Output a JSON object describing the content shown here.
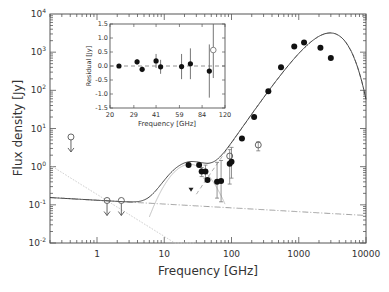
{
  "chart_data": {
    "type": "scatter",
    "title": "",
    "xlabel": "Frequency [GHz]",
    "ylabel": "Flux density [Jy]",
    "xscale": "log",
    "yscale": "log",
    "xlim": [
      0.2,
      10000
    ],
    "ylim": [
      0.01,
      10000
    ],
    "x_ticks": [
      "1",
      "10",
      "100",
      "1000",
      "10000"
    ],
    "y_ticks": [
      "10^-2",
      "10^-1",
      "10^0",
      "10^1",
      "10^2",
      "10^3",
      "10^4"
    ],
    "grid": false,
    "series": [
      {
        "name": "detections (filled)",
        "marker": "filled-circle",
        "points": [
          [
            23,
            1.1
          ],
          [
            33,
            1.1
          ],
          [
            36,
            0.75
          ],
          [
            41,
            0.75
          ],
          [
            44,
            0.45
          ],
          [
            61,
            0.4
          ],
          [
            70,
            0.42
          ],
          [
            94,
            1.2
          ],
          [
            100,
            1.35
          ],
          [
            143,
            5.5
          ],
          [
            217,
            20
          ],
          [
            353,
            95
          ],
          [
            545,
            400
          ],
          [
            857,
            1400
          ],
          [
            1200,
            1800
          ],
          [
            2100,
            1300
          ],
          [
            3000,
            700
          ]
        ]
      },
      {
        "name": "open circles",
        "marker": "open-circle",
        "points": [
          [
            94,
            1.9
          ],
          [
            250,
            3.7
          ]
        ]
      },
      {
        "name": "upper limits",
        "marker": "open-circle-arrow",
        "points": [
          [
            0.41,
            6.0
          ],
          [
            1.41,
            0.13
          ],
          [
            2.3,
            0.13
          ]
        ]
      },
      {
        "name": "triangle",
        "marker": "filled-triangle-down",
        "points": [
          [
            25,
            0.25
          ]
        ]
      },
      {
        "name": "total model",
        "style": "solid"
      },
      {
        "name": "free-free",
        "style": "dash-dot"
      },
      {
        "name": "synchrotron",
        "style": "dotted-grey"
      },
      {
        "name": "spinning dust",
        "style": "solid-grey"
      },
      {
        "name": "thermal dust low-freq",
        "style": "dashed-grey"
      }
    ],
    "inset": {
      "xlabel": "Frequency [GHz]",
      "ylabel": "Residual [Jy]",
      "xscale": "log",
      "xlim": [
        20,
        120
      ],
      "ylim": [
        -1.5,
        1.5
      ],
      "x_ticks": [
        "20",
        "29",
        "41",
        "59",
        "84",
        "120"
      ],
      "y_ticks": [
        "1.5",
        "1.0",
        "0.5",
        "0.0",
        "-0.5",
        "-1.0",
        "-1.5"
      ],
      "residuals": [
        {
          "x": 23,
          "y": 0.0,
          "err": 0.02,
          "filled": true
        },
        {
          "x": 30.5,
          "y": 0.15,
          "err": 0.1,
          "filled": true
        },
        {
          "x": 33,
          "y": -0.12,
          "err": 0.1,
          "filled": true
        },
        {
          "x": 41,
          "y": 0.18,
          "err": 0.25,
          "filled": true
        },
        {
          "x": 44,
          "y": -0.03,
          "err": 0.25,
          "filled": true
        },
        {
          "x": 61,
          "y": -0.02,
          "err": 0.45,
          "filled": true
        },
        {
          "x": 70,
          "y": 0.08,
          "err": 0.55,
          "filled": true
        },
        {
          "x": 94,
          "y": -0.18,
          "err": 0.95,
          "filled": true
        },
        {
          "x": 100,
          "y": 0.57,
          "err": 1.0,
          "filled": false
        }
      ]
    }
  }
}
